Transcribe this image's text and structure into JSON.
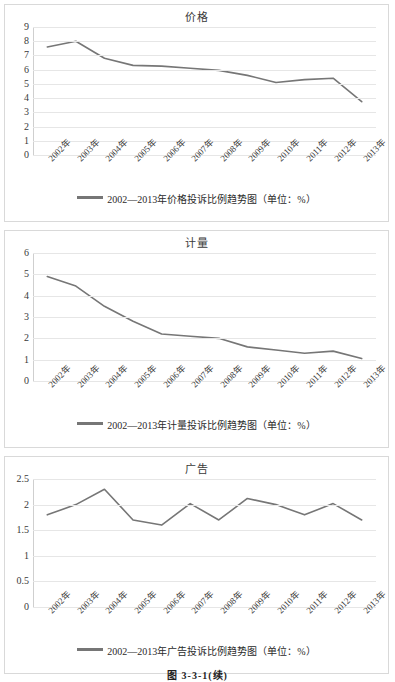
{
  "figure_caption": "图 3-3-1(续)",
  "charts": [
    {
      "title": "价格",
      "legend": "2002—2013年价格投诉比例趋势图（单位：%）",
      "series_color": "#767676",
      "yticks": [
        "0",
        "1",
        "2",
        "3",
        "4",
        "5",
        "6",
        "7",
        "8",
        "9"
      ],
      "xlabels": [
        "2002年",
        "2003年",
        "2004年",
        "2005年",
        "2006年",
        "2007年",
        "2008年",
        "2009年",
        "2010年",
        "2011年",
        "2012年",
        "2013年"
      ]
    },
    {
      "title": "计量",
      "legend": "2002—2013年计量投诉比例趋势图（单位：%）",
      "series_color": "#767676",
      "yticks": [
        "0",
        "1",
        "2",
        "3",
        "4",
        "5",
        "6"
      ],
      "xlabels": [
        "2002年",
        "2003年",
        "2004年",
        "2005年",
        "2006年",
        "2007年",
        "2008年",
        "2009年",
        "2010年",
        "2011年",
        "2012年",
        "2013年"
      ]
    },
    {
      "title": "广告",
      "legend": "2002—2013年广告投诉比例趋势图（单位：%）",
      "series_color": "#767676",
      "yticks": [
        "0",
        "0.5",
        "1",
        "1.5",
        "2",
        "2.5"
      ],
      "xlabels": [
        "2002年",
        "2003年",
        "2004年",
        "2005年",
        "2006年",
        "2007年",
        "2008年",
        "2009年",
        "2010年",
        "2011年",
        "2012年",
        "2013年"
      ]
    }
  ],
  "chart_data": [
    {
      "type": "line",
      "title": "价格",
      "xlabel": "",
      "ylabel": "",
      "ylim": [
        0,
        9
      ],
      "yticks": [
        0,
        1,
        2,
        3,
        4,
        5,
        6,
        7,
        8,
        9
      ],
      "grid": true,
      "legend_position": "bottom",
      "legend": [
        "2002—2013年价格投诉比例趋势图（单位：%）"
      ],
      "categories": [
        "2002年",
        "2003年",
        "2004年",
        "2005年",
        "2006年",
        "2007年",
        "2008年",
        "2009年",
        "2010年",
        "2011年",
        "2012年",
        "2013年"
      ],
      "values": [
        7.6,
        8.0,
        6.8,
        6.3,
        6.25,
        6.1,
        5.95,
        5.6,
        5.1,
        5.3,
        5.4,
        3.75
      ],
      "units": "%"
    },
    {
      "type": "line",
      "title": "计量",
      "xlabel": "",
      "ylabel": "",
      "ylim": [
        0,
        6
      ],
      "yticks": [
        0,
        1,
        2,
        3,
        4,
        5,
        6
      ],
      "grid": true,
      "legend_position": "bottom",
      "legend": [
        "2002—2013年计量投诉比例趋势图（单位：%）"
      ],
      "categories": [
        "2002年",
        "2003年",
        "2004年",
        "2005年",
        "2006年",
        "2007年",
        "2008年",
        "2009年",
        "2010年",
        "2011年",
        "2012年",
        "2013年"
      ],
      "values": [
        4.9,
        4.45,
        3.5,
        2.8,
        2.2,
        2.1,
        2.0,
        1.6,
        1.45,
        1.3,
        1.4,
        1.05
      ],
      "units": "%"
    },
    {
      "type": "line",
      "title": "广告",
      "xlabel": "",
      "ylabel": "",
      "ylim": [
        0,
        2.5
      ],
      "yticks": [
        0,
        0.5,
        1,
        1.5,
        2,
        2.5
      ],
      "grid": true,
      "legend_position": "bottom",
      "legend": [
        "2002—2013年广告投诉比例趋势图（单位：%）"
      ],
      "categories": [
        "2002年",
        "2003年",
        "2004年",
        "2005年",
        "2006年",
        "2007年",
        "2008年",
        "2009年",
        "2010年",
        "2011年",
        "2012年",
        "2013年"
      ],
      "values": [
        1.8,
        2.0,
        2.3,
        1.7,
        1.6,
        2.02,
        1.7,
        2.12,
        2.0,
        1.8,
        2.02,
        1.7
      ],
      "units": "%"
    }
  ]
}
